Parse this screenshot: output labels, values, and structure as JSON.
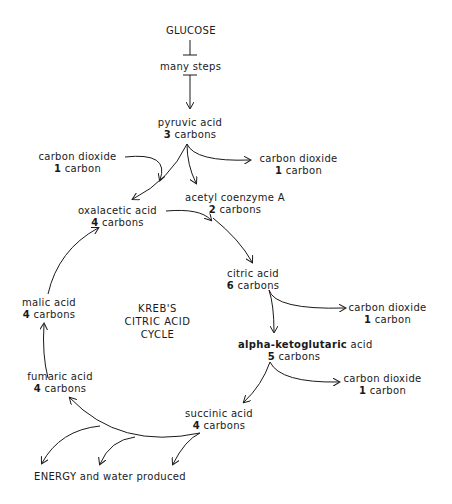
{
  "diagram": {
    "type": "flowchart",
    "title": "KREB'S CITRIC ACID CYCLE",
    "cycle_label_lines": [
      "KREB'S",
      "CITRIC ACID",
      "CYCLE"
    ],
    "nodes": {
      "glucose": {
        "name": "GLUCOSE"
      },
      "many_steps": {
        "name": "many steps"
      },
      "pyruvic": {
        "name": "pyruvic acid",
        "count_num": "3",
        "count_unit": "carbons"
      },
      "co2_in": {
        "name": "carbon dioxide",
        "count_num": "1",
        "count_unit": "carbon"
      },
      "co2_out1": {
        "name": "carbon dioxide",
        "count_num": "1",
        "count_unit": "carbon"
      },
      "acetyl": {
        "name": "acetyl coenzyme A",
        "count_num": "2",
        "count_unit": "carbons"
      },
      "oxalacetic": {
        "name": "oxalacetic acid",
        "count_num": "4",
        "count_unit": "carbons"
      },
      "citric": {
        "name": "citric acid",
        "count_num": "6",
        "count_unit": "carbons"
      },
      "co2_out2": {
        "name": "carbon dioxide",
        "count_num": "1",
        "count_unit": "carbon"
      },
      "alpha": {
        "name_bold": "alpha-ketoglutaric",
        "name_rest": " acid",
        "count_num": "5",
        "count_unit": "carbons"
      },
      "co2_out3": {
        "name": "carbon dioxide",
        "count_num": "1",
        "count_unit": "carbon"
      },
      "succinic": {
        "name": "succinic acid",
        "count_num": "4",
        "count_unit": "carbons"
      },
      "fumaric": {
        "name": "fumaric acid",
        "count_num": "4",
        "count_unit": "carbons"
      },
      "malic": {
        "name": "malic acid",
        "count_num": "4",
        "count_unit": "carbons"
      },
      "energy": {
        "name": "ENERGY and water produced"
      }
    },
    "edges": [
      {
        "from": "GLUCOSE",
        "to": "many steps"
      },
      {
        "from": "many steps",
        "to": "pyruvic acid"
      },
      {
        "from": "pyruvic acid",
        "to": "carbon dioxide (1 carbon)"
      },
      {
        "from": "pyruvic acid",
        "to": "acetyl coenzyme A"
      },
      {
        "from": "pyruvic acid",
        "to": "oxalacetic acid"
      },
      {
        "from": "carbon dioxide (input)",
        "to": "oxalacetic acid"
      },
      {
        "from": "oxalacetic acid",
        "to": "citric acid"
      },
      {
        "from": "acetyl coenzyme A",
        "to": "citric acid"
      },
      {
        "from": "citric acid",
        "to": "carbon dioxide (1 carbon)"
      },
      {
        "from": "citric acid",
        "to": "alpha-ketoglutaric acid"
      },
      {
        "from": "alpha-ketoglutaric acid",
        "to": "carbon dioxide (1 carbon)"
      },
      {
        "from": "alpha-ketoglutaric acid",
        "to": "succinic acid"
      },
      {
        "from": "succinic acid",
        "to": "fumaric acid"
      },
      {
        "from": "succinic acid",
        "to": "ENERGY and water produced"
      },
      {
        "from": "fumaric acid",
        "to": "malic acid"
      },
      {
        "from": "malic acid",
        "to": "oxalacetic acid"
      }
    ],
    "colors": {
      "ink": "#1a1a1a",
      "background": "#ffffff"
    }
  }
}
